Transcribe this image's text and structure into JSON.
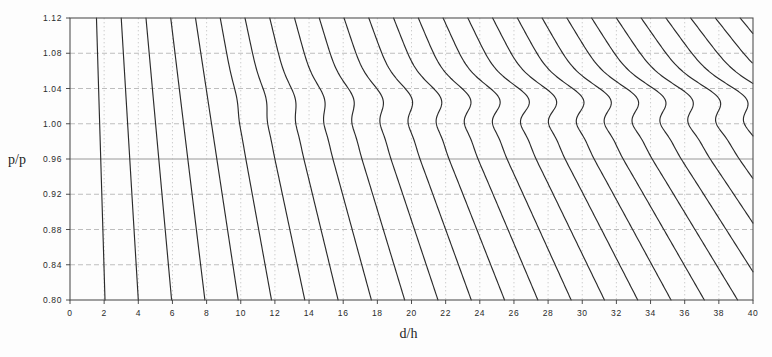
{
  "figure": {
    "name": "pressure-ratio-chart",
    "background_color": "#fdfdfd",
    "frame_color": "#4a4a4a",
    "curve_color": "#2b2b2b",
    "grid_color": "#9a9a9a",
    "caption": ""
  },
  "chart_data": {
    "type": "line",
    "title": "",
    "subtitle": "",
    "xlabel": "d/h",
    "ylabel": "p/p",
    "xlim": [
      0,
      40
    ],
    "ylim": [
      0.8,
      1.12
    ],
    "xticks": [
      0,
      2,
      4,
      6,
      8,
      10,
      12,
      14,
      16,
      18,
      20,
      22,
      24,
      26,
      28,
      30,
      32,
      34,
      36,
      38,
      40
    ],
    "xtick_labels": [
      "0",
      "2",
      "4",
      "6",
      "8",
      "10",
      "12",
      "14",
      "16",
      "18",
      "20",
      "22",
      "24",
      "26",
      "28",
      "30",
      "32",
      "34",
      "36",
      "38",
      "40"
    ],
    "yticks": [
      0.8,
      0.84,
      0.88,
      0.92,
      0.96,
      1.0,
      1.04,
      1.08,
      1.12
    ],
    "ytick_labels": [
      "0.80",
      "0.84",
      "0.88",
      "0.92",
      "0.96",
      "1.00",
      "1.04",
      "1.08",
      "1.12"
    ],
    "grid": true,
    "grid_style": "dashed",
    "legend": "none",
    "legend_entries": [],
    "annotations": [],
    "series_count": 27,
    "series_description": "Family of nearly parallel characteristic curves descending left-to-right; steep and close to straight at low d/h, becoming progressively more inclined and developing an S-shaped plateau near p/p = 1.00-1.04 at higher d/h.",
    "series": [
      {
        "name": "curve-01",
        "x_at_top": 1.55,
        "x_at_bottom": 2.05,
        "shape": "steep"
      },
      {
        "name": "curve-02",
        "x_at_top": 3.0,
        "x_at_bottom": 4.0,
        "shape": "steep"
      },
      {
        "name": "curve-03",
        "x_at_top": 4.45,
        "x_at_bottom": 5.95,
        "shape": "steep"
      },
      {
        "name": "curve-04",
        "x_at_top": 5.9,
        "x_at_bottom": 7.9,
        "shape": "steep"
      },
      {
        "name": "curve-05",
        "x_at_top": 7.35,
        "x_at_bottom": 9.85,
        "shape": "steep"
      },
      {
        "name": "curve-06",
        "x_at_top": 8.8,
        "x_at_bottom": 11.8,
        "shape": "steep"
      },
      {
        "name": "curve-07",
        "x_at_top": 10.25,
        "x_at_bottom": 13.75,
        "shape": "mild-s"
      },
      {
        "name": "curve-08",
        "x_at_top": 11.7,
        "x_at_bottom": 15.7,
        "shape": "mild-s"
      },
      {
        "name": "curve-09",
        "x_at_top": 13.15,
        "x_at_bottom": 17.65,
        "shape": "mild-s"
      },
      {
        "name": "curve-10",
        "x_at_top": 14.6,
        "x_at_bottom": 19.6,
        "shape": "mild-s"
      },
      {
        "name": "curve-11",
        "x_at_top": 16.05,
        "x_at_bottom": 21.55,
        "shape": "s-curve"
      },
      {
        "name": "curve-12",
        "x_at_top": 17.5,
        "x_at_bottom": 23.5,
        "shape": "s-curve"
      },
      {
        "name": "curve-13",
        "x_at_top": 18.95,
        "x_at_bottom": 25.45,
        "shape": "s-curve"
      },
      {
        "name": "curve-14",
        "x_at_top": 20.4,
        "x_at_bottom": 27.4,
        "shape": "s-curve"
      },
      {
        "name": "curve-15",
        "x_at_top": 21.85,
        "x_at_bottom": 29.35,
        "shape": "s-curve"
      },
      {
        "name": "curve-16",
        "x_at_top": 23.3,
        "x_at_bottom": 31.3,
        "shape": "s-curve"
      },
      {
        "name": "curve-17",
        "x_at_top": 24.75,
        "x_at_bottom": 33.25,
        "shape": "s-curve"
      },
      {
        "name": "curve-18",
        "x_at_top": 26.2,
        "x_at_bottom": 35.2,
        "shape": "s-curve"
      },
      {
        "name": "curve-19",
        "x_at_top": 27.65,
        "x_at_bottom": 37.15,
        "shape": "s-curve"
      },
      {
        "name": "curve-20",
        "x_at_top": 29.1,
        "x_at_bottom": 39.1,
        "shape": "s-curve"
      },
      {
        "name": "curve-21",
        "x_at_top": 30.55,
        "x_at_bottom": 41.05,
        "shape": "s-curve"
      },
      {
        "name": "curve-22",
        "x_at_top": 32.0,
        "x_at_bottom": 43.0,
        "shape": "s-curve"
      },
      {
        "name": "curve-23",
        "x_at_top": 33.45,
        "x_at_bottom": 44.95,
        "shape": "s-curve"
      },
      {
        "name": "curve-24",
        "x_at_top": 34.9,
        "x_at_bottom": 46.9,
        "shape": "s-curve"
      },
      {
        "name": "curve-25",
        "x_at_top": 36.35,
        "x_at_bottom": 48.85,
        "shape": "s-curve"
      },
      {
        "name": "curve-26",
        "x_at_top": 37.8,
        "x_at_bottom": 50.8,
        "shape": "s-curve"
      },
      {
        "name": "curve-27",
        "x_at_top": 39.25,
        "x_at_bottom": 52.75,
        "shape": "s-curve"
      }
    ]
  }
}
